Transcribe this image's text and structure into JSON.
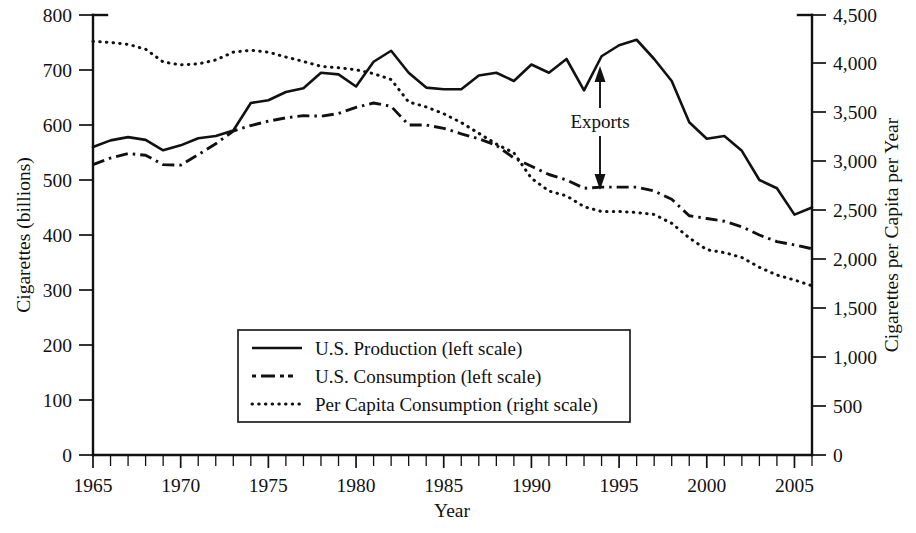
{
  "chart_data": {
    "type": "line",
    "title": "",
    "xlabel": "Year",
    "ylabel": "Cigarettes (billions)",
    "y2label": "Cigarettes per Capita per Year",
    "xlim": [
      1965,
      2006
    ],
    "ylim": [
      0,
      800
    ],
    "y2lim": [
      0,
      4500
    ],
    "grid": false,
    "legend_position": "lower-center",
    "x_tick_labels": [
      "1965",
      "1970",
      "1975",
      "1980",
      "1985",
      "1990",
      "1995",
      "2000",
      "2005"
    ],
    "x_tick_values": [
      1965,
      1970,
      1975,
      1980,
      1985,
      1990,
      1995,
      2000,
      2005
    ],
    "x_minor_tick_step": 1,
    "y_tick_labels": [
      "0",
      "100",
      "200",
      "300",
      "400",
      "500",
      "600",
      "700",
      "800"
    ],
    "y_tick_values": [
      0,
      100,
      200,
      300,
      400,
      500,
      600,
      700,
      800
    ],
    "y2_tick_labels": [
      "0",
      "500",
      "1,000",
      "1,500",
      "2,000",
      "2,500",
      "3,000",
      "3,500",
      "4,000",
      "4,500"
    ],
    "y2_tick_values": [
      0,
      500,
      1000,
      1500,
      2000,
      2500,
      3000,
      3500,
      4000,
      4500
    ],
    "x": [
      1965,
      1966,
      1967,
      1968,
      1969,
      1970,
      1971,
      1972,
      1973,
      1974,
      1975,
      1976,
      1977,
      1978,
      1979,
      1980,
      1981,
      1982,
      1983,
      1984,
      1985,
      1986,
      1987,
      1988,
      1989,
      1990,
      1991,
      1992,
      1993,
      1994,
      1995,
      1996,
      1997,
      1998,
      1999,
      2000,
      2001,
      2002,
      2003,
      2004,
      2005,
      2006
    ],
    "series": [
      {
        "name": "U.S. Production (left scale)",
        "axis": "left",
        "style": "solid",
        "units": "billions",
        "values": [
          560,
          572,
          578,
          573,
          554,
          563,
          576,
          580,
          590,
          640,
          645,
          660,
          667,
          695,
          692,
          670,
          715,
          735,
          695,
          668,
          665,
          665,
          690,
          695,
          680,
          710,
          695,
          720,
          663,
          725,
          745,
          755,
          720,
          680,
          605,
          575,
          580,
          553,
          500,
          485,
          437,
          450
        ]
      },
      {
        "name": "U.S. Consumption (left scale)",
        "axis": "left",
        "style": "dash-dot",
        "units": "billions",
        "values": [
          528,
          540,
          548,
          545,
          528,
          527,
          546,
          566,
          589,
          599,
          607,
          613,
          617,
          616,
          621,
          632,
          640,
          634,
          600,
          600,
          594,
          584,
          575,
          563,
          540,
          525,
          510,
          500,
          485,
          487,
          487,
          487,
          480,
          465,
          435,
          430,
          425,
          415,
          400,
          388,
          382,
          375
        ]
      },
      {
        "name": "Per Capita Consumption (right scale)",
        "axis": "right",
        "style": "dotted",
        "units": "cigarettes per capita per year",
        "values": [
          4230,
          4220,
          4200,
          4150,
          4020,
          3990,
          4000,
          4040,
          4120,
          4140,
          4120,
          4070,
          4025,
          3975,
          3960,
          3940,
          3900,
          3840,
          3610,
          3560,
          3490,
          3400,
          3290,
          3180,
          3090,
          2830,
          2700,
          2650,
          2540,
          2490,
          2490,
          2480,
          2460,
          2370,
          2220,
          2100,
          2070,
          2020,
          1920,
          1840,
          1790,
          1730
        ]
      }
    ],
    "annotations": [
      {
        "id": "exports-annotation",
        "label": "Exports",
        "kind": "double-arrow",
        "x_year": 1994,
        "y_top": 720,
        "y_bottom": 487,
        "description": "Double-headed vertical arrow between the production and consumption curves labeled Exports"
      }
    ],
    "legend": [
      {
        "label": "U.S. Production (left scale)",
        "style": "solid"
      },
      {
        "label": "U.S. Consumption (left scale)",
        "style": "dash-dot"
      },
      {
        "label": "Per Capita Consumption (right scale)",
        "style": "dotted"
      }
    ],
    "colors": {
      "line": "#111111",
      "text": "#111111",
      "background": "#ffffff"
    }
  }
}
